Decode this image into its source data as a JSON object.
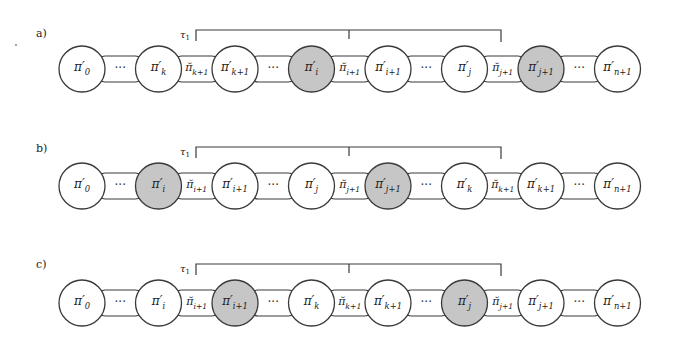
{
  "diagram": {
    "colors": {
      "stroke": "#3a3a3a",
      "gray_fill": "#c6c6c6",
      "white_fill": "#ffffff"
    },
    "bracket_label": "τ1",
    "rows": [
      {
        "label": "a)",
        "nodes": [
          {
            "type": "circle",
            "text": "π′",
            "sub": "0",
            "fill": "white"
          },
          {
            "type": "dots",
            "text": "···"
          },
          {
            "type": "circle",
            "text": "π′",
            "sub": "k",
            "fill": "white"
          },
          {
            "type": "connector",
            "text": "π̆",
            "sub": "k+1"
          },
          {
            "type": "circle",
            "text": "π′",
            "sub": "k+1",
            "fill": "white"
          },
          {
            "type": "dots",
            "text": "···"
          },
          {
            "type": "circle",
            "text": "π′",
            "sub": "i",
            "fill": "gray"
          },
          {
            "type": "connector",
            "text": "π̆",
            "sub": "i+1"
          },
          {
            "type": "circle",
            "text": "π′",
            "sub": "i+1",
            "fill": "white"
          },
          {
            "type": "dots",
            "text": "···"
          },
          {
            "type": "circle",
            "text": "π′",
            "sub": "j",
            "fill": "white"
          },
          {
            "type": "connector",
            "text": "π̆",
            "sub": "j+1"
          },
          {
            "type": "circle",
            "text": "π′",
            "sub": "j+1",
            "fill": "gray"
          },
          {
            "type": "dots",
            "text": "···"
          },
          {
            "type": "circle",
            "text": "π′",
            "sub": "n+1",
            "fill": "white"
          }
        ]
      },
      {
        "label": "b)",
        "nodes": [
          {
            "type": "circle",
            "text": "π′",
            "sub": "0",
            "fill": "white"
          },
          {
            "type": "dots",
            "text": "···"
          },
          {
            "type": "circle",
            "text": "π′",
            "sub": "i",
            "fill": "gray"
          },
          {
            "type": "connector",
            "text": "π̆",
            "sub": "i+1"
          },
          {
            "type": "circle",
            "text": "π′",
            "sub": "i+1",
            "fill": "white"
          },
          {
            "type": "dots",
            "text": "···"
          },
          {
            "type": "circle",
            "text": "π′",
            "sub": "j",
            "fill": "white"
          },
          {
            "type": "connector",
            "text": "π̆",
            "sub": "j+1"
          },
          {
            "type": "circle",
            "text": "π′",
            "sub": "j+1",
            "fill": "gray"
          },
          {
            "type": "dots",
            "text": "···"
          },
          {
            "type": "circle",
            "text": "π′",
            "sub": "k",
            "fill": "white"
          },
          {
            "type": "connector",
            "text": "π̆",
            "sub": "k+1"
          },
          {
            "type": "circle",
            "text": "π′",
            "sub": "k+1",
            "fill": "white"
          },
          {
            "type": "dots",
            "text": "···"
          },
          {
            "type": "circle",
            "text": "π′",
            "sub": "n+1",
            "fill": "white"
          }
        ]
      },
      {
        "label": "c)",
        "nodes": [
          {
            "type": "circle",
            "text": "π′",
            "sub": "0",
            "fill": "white"
          },
          {
            "type": "dots",
            "text": "···"
          },
          {
            "type": "circle",
            "text": "π′",
            "sub": "i",
            "fill": "white"
          },
          {
            "type": "connector",
            "text": "π̆",
            "sub": "i+1"
          },
          {
            "type": "circle",
            "text": "π′",
            "sub": "i+1",
            "fill": "gray"
          },
          {
            "type": "dots",
            "text": "···"
          },
          {
            "type": "circle",
            "text": "π′",
            "sub": "k",
            "fill": "white"
          },
          {
            "type": "connector",
            "text": "π̆",
            "sub": "k+1"
          },
          {
            "type": "circle",
            "text": "π′",
            "sub": "k+1",
            "fill": "white"
          },
          {
            "type": "dots",
            "text": "···"
          },
          {
            "type": "circle",
            "text": "π′",
            "sub": "j",
            "fill": "gray"
          },
          {
            "type": "connector",
            "text": "π̆",
            "sub": "j+1"
          },
          {
            "type": "circle",
            "text": "π′",
            "sub": "j+1",
            "fill": "white"
          },
          {
            "type": "dots",
            "text": "···"
          },
          {
            "type": "circle",
            "text": "π′",
            "sub": "n+1",
            "fill": "white"
          }
        ]
      }
    ]
  }
}
